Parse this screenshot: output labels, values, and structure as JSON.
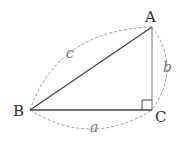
{
  "diagram": {
    "type": "right-triangle",
    "vertices": [
      {
        "id": "A",
        "label": "A",
        "x": 152,
        "y": 27
      },
      {
        "id": "B",
        "label": "B",
        "x": 30,
        "y": 110
      },
      {
        "id": "C",
        "label": "C",
        "x": 152,
        "y": 110
      }
    ],
    "sides": [
      {
        "id": "a",
        "label": "a",
        "from": "B",
        "to": "C"
      },
      {
        "id": "b",
        "label": "b",
        "from": "C",
        "to": "A"
      },
      {
        "id": "c",
        "label": "c",
        "from": "B",
        "to": "A"
      }
    ],
    "right_angle_at": "C",
    "colors": {
      "line": "#444444",
      "dashed": "#999999",
      "text": "#333333"
    }
  }
}
